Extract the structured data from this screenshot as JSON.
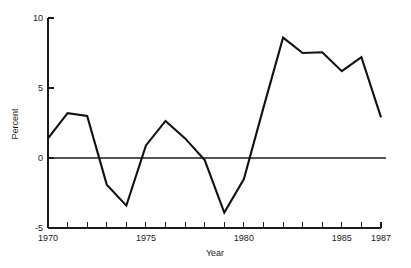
{
  "chart_data": {
    "type": "line",
    "title": "",
    "xlabel": "Year",
    "ylabel": "Percent",
    "x": [
      1970,
      1971,
      1972,
      1973,
      1974,
      1975,
      1976,
      1977,
      1978,
      1979,
      1980,
      1981,
      1982,
      1983,
      1984,
      1985,
      1986,
      1987
    ],
    "values": [
      1.4,
      3.2,
      3.0,
      -1.9,
      -3.4,
      0.9,
      2.65,
      1.4,
      -0.15,
      -3.9,
      -1.5,
      3.6,
      8.6,
      7.5,
      7.55,
      6.2,
      7.2,
      2.9
    ],
    "series": [
      {
        "name": "Percent",
        "values": [
          1.4,
          3.2,
          3.0,
          -1.9,
          -3.4,
          0.9,
          2.65,
          1.4,
          -0.15,
          -3.9,
          -1.5,
          3.6,
          8.6,
          7.5,
          7.55,
          6.2,
          7.2,
          2.9
        ]
      }
    ],
    "xlim": [
      1970,
      1987
    ],
    "ylim": [
      -5,
      10
    ],
    "yticks": [
      -5,
      0,
      5,
      10
    ],
    "ytick_labels": [
      "-5",
      "0",
      "5",
      "10"
    ],
    "xticks": [
      1970,
      1971,
      1972,
      1973,
      1974,
      1975,
      1976,
      1977,
      1978,
      1979,
      1980,
      1981,
      1982,
      1983,
      1984,
      1985,
      1986,
      1987
    ],
    "xtick_labels_shown": [
      "1970",
      "1975",
      "1980",
      "1985",
      "1987"
    ],
    "xtick_labeled_values": [
      1970,
      1975,
      1980,
      1985,
      1987
    ],
    "grid": false,
    "legend": false,
    "legend_position": "none",
    "zero_reference_line": 0,
    "line_color": "#111111",
    "zero_line_color": "#555555",
    "axis_color": "#1a1a1a",
    "background_color": "#ffffff"
  },
  "axes": {
    "y_title": "Percent",
    "x_title": "Year"
  }
}
